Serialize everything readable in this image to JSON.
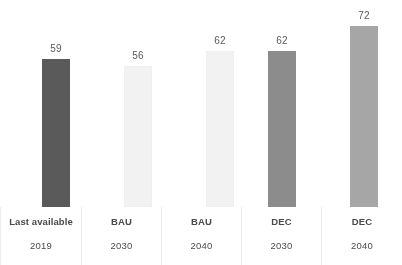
{
  "chart_data": {
    "type": "bar",
    "title": "",
    "subtitle": "",
    "xlabel": "",
    "ylabel": "",
    "grid": false,
    "legend": "none",
    "ylim": [
      0,
      80
    ],
    "categories": [
      "Last available 2019",
      "BAU 2030",
      "BAU 2040",
      "DEC 2030",
      "DEC 2040"
    ],
    "values": [
      59,
      56,
      62,
      62,
      72
    ],
    "bar_colors": [
      "#5a5a5a",
      "#f2f2f2",
      "#f2f2f2",
      "#8c8c8c",
      "#a6a6a6"
    ],
    "data_labels": [
      "59",
      "56",
      "62",
      "62",
      "72"
    ],
    "series": [
      {
        "name": "",
        "values": [
          59,
          56,
          62,
          62,
          72
        ]
      }
    ]
  },
  "axis": {
    "columns": [
      {
        "scenario": "Last available",
        "year": "2019"
      },
      {
        "scenario": "BAU",
        "year": "2030"
      },
      {
        "scenario": "BAU",
        "year": "2040"
      },
      {
        "scenario": "DEC",
        "year": "2030"
      },
      {
        "scenario": "DEC",
        "year": "2040"
      }
    ]
  },
  "bars": [
    {
      "label": "59",
      "value": 59,
      "color": "#5a5a5a",
      "height_px": 148,
      "center_x": 56
    },
    {
      "label": "56",
      "value": 56,
      "color": "#f2f2f2",
      "height_px": 141,
      "center_x": 138
    },
    {
      "label": "62",
      "value": 62,
      "color": "#f2f2f2",
      "height_px": 156,
      "center_x": 220
    },
    {
      "label": "62",
      "value": 62,
      "color": "#8c8c8c",
      "height_px": 156,
      "center_x": 282
    },
    {
      "label": "72",
      "value": 72,
      "color": "#a6a6a6",
      "height_px": 181,
      "center_x": 364
    }
  ],
  "style": {
    "background": "#ffffff",
    "label_color": "#4a4a4a",
    "value_color": "#595959",
    "separator_color": "#ededed"
  }
}
